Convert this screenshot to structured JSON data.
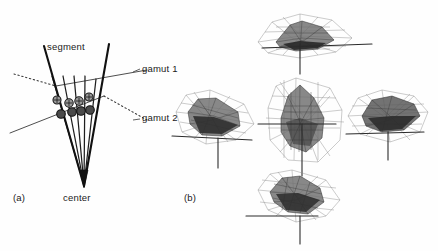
{
  "figure": {
    "background_color": "#fefefe",
    "ink_color": "#1a1a1a"
  },
  "panel_a": {
    "label": "(a)",
    "labels": {
      "segment": "segment",
      "gamut1": "gamut 1",
      "gamut2": "gamut 2",
      "center": "center"
    },
    "description": "Fan of rays emanating from a center point, bounded by two thick segment lines, intersected by two gamut boundary lines. Sample points marked where rays cross each gamut boundary.",
    "center_point": {
      "x": 84,
      "y": 185
    },
    "ray_count": 6,
    "gamut1_points": [
      {
        "x": 57,
        "y": 100
      },
      {
        "x": 69,
        "y": 103
      },
      {
        "x": 79,
        "y": 101
      },
      {
        "x": 89,
        "y": 97
      }
    ],
    "gamut2_points": [
      {
        "x": 61,
        "y": 114
      },
      {
        "x": 72,
        "y": 112
      },
      {
        "x": 81,
        "y": 110
      },
      {
        "x": 90,
        "y": 109
      }
    ],
    "gamut1_style": "solid line with dotted extension, light hatched markers",
    "gamut2_style": "solid line with dotted extension, dark filled markers"
  },
  "panel_b": {
    "label": "(b)",
    "description": "Five rendered 3D colour gamut views of the same object shown from different viewing directions, arranged in a cross layout. Each shows a light wireframe hull enclosing a darker shaded inner gamut solid, with horizontal and vertical axis lines.",
    "view_count": 5,
    "views": [
      {
        "position": "top",
        "name": "top-view",
        "cx": 300,
        "cy": 38
      },
      {
        "position": "left",
        "name": "left-view",
        "cx": 218,
        "cy": 122
      },
      {
        "position": "center",
        "name": "center-view",
        "cx": 303,
        "cy": 124
      },
      {
        "position": "right",
        "name": "right-view",
        "cx": 386,
        "cy": 120
      },
      {
        "position": "bottom",
        "name": "bottom-view",
        "cx": 300,
        "cy": 200
      }
    ]
  }
}
